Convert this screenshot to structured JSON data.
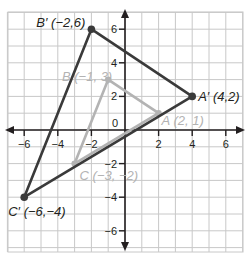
{
  "diagram": {
    "type": "coordinate-plane-dilation",
    "grid": {
      "xmin": -7,
      "xmax": 7,
      "ymin": -7,
      "ymax": 7,
      "step": 1,
      "tick_labels_x": [
        "-6",
        "-4",
        "-2",
        "2",
        "4",
        "6"
      ],
      "tick_values_x": [
        -6,
        -4,
        -2,
        2,
        4,
        6
      ],
      "tick_labels_y": [
        "6",
        "4",
        "2",
        "-2",
        "-4",
        "-6"
      ],
      "tick_values_y": [
        6,
        4,
        2,
        -2,
        -4,
        -6
      ],
      "origin_label": "0"
    },
    "colors": {
      "grid": "#c8c8c8",
      "axis": "#231f20",
      "image_triangle": "#3a3a3a",
      "preimage_triangle": "#b3b3b3"
    },
    "preimage": {
      "name": "ABC",
      "points": [
        {
          "name": "A",
          "x": 2,
          "y": 1,
          "label": "A (2, 1)"
        },
        {
          "name": "B",
          "x": -1,
          "y": 3,
          "label": "B (-1, 3)"
        },
        {
          "name": "C",
          "x": -3,
          "y": -2,
          "label": "C (-3, -2)"
        }
      ]
    },
    "image": {
      "name": "A'B'C'",
      "points": [
        {
          "name": "A'",
          "x": 4,
          "y": 2,
          "label": "A′ (4,2)"
        },
        {
          "name": "B'",
          "x": -2,
          "y": 6,
          "label": "B′ (-2,6)"
        },
        {
          "name": "C'",
          "x": -6,
          "y": -4,
          "label": "C′ (-6,-4)"
        }
      ]
    }
  }
}
